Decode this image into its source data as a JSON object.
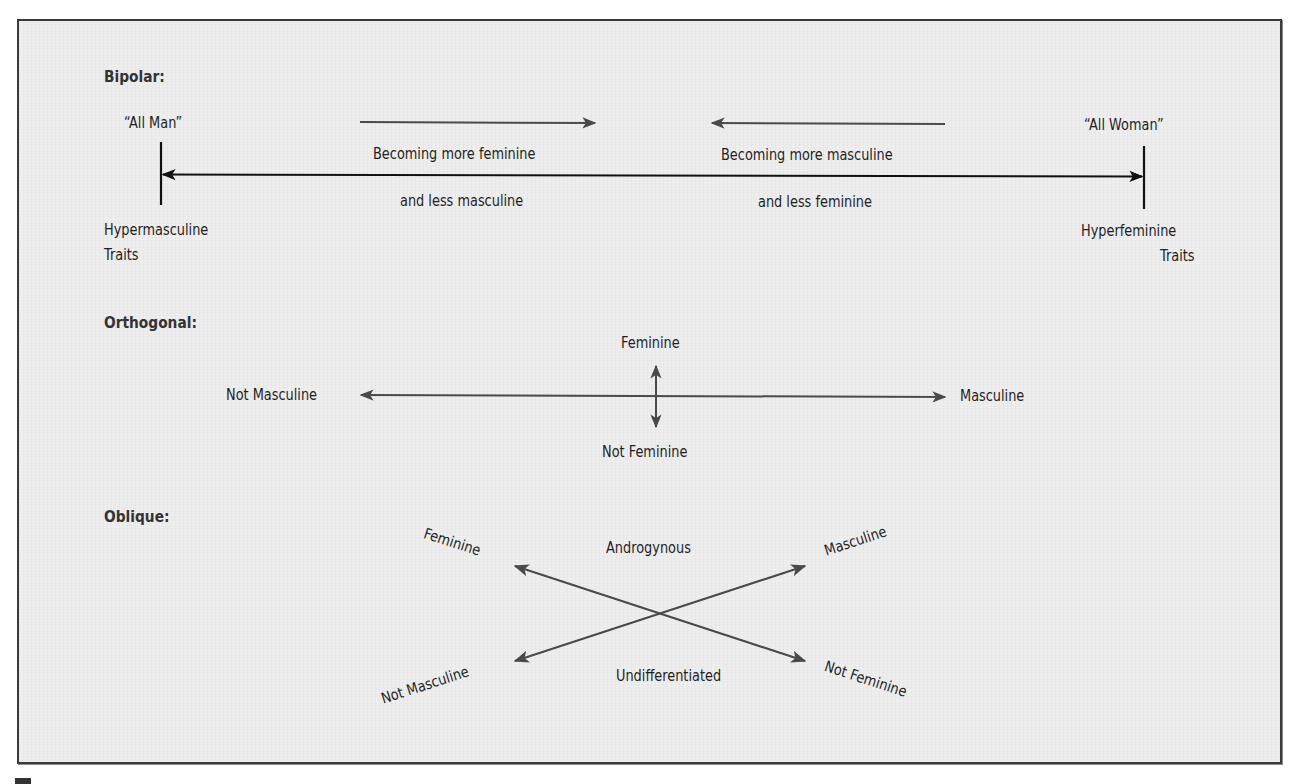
{
  "sections": {
    "bipolar": {
      "heading": "Bipolar:",
      "left_pole": "“All Man”",
      "right_pole": "“All Woman”",
      "left_trait_line1": "Hypermasculine",
      "left_trait_line2": "Traits",
      "right_trait_line1": "Hyperfeminine",
      "right_trait_line2": "Traits",
      "arrow_right_label_line1": "Becoming more feminine",
      "arrow_right_label_line2": "and less masculine",
      "arrow_left_label_line1": "Becoming more masculine",
      "arrow_left_label_line2": "and less feminine"
    },
    "orthogonal": {
      "heading": "Orthogonal:",
      "top": "Feminine",
      "bottom": "Not Feminine",
      "left": "Not Masculine",
      "right": "Masculine"
    },
    "oblique": {
      "heading": "Oblique:",
      "top_left": "Feminine",
      "top_center": "Androgynous",
      "top_right": "Masculine",
      "bottom_left": "Not Masculine",
      "bottom_center": "Undifferentiated",
      "bottom_right": "Not Feminine"
    }
  },
  "colors": {
    "panel_background": "#ececec",
    "border": "#3b3b3b",
    "arrow_dark": "#111111",
    "arrow_grey": "#4a4a4a",
    "text": "#1f1f1f"
  }
}
